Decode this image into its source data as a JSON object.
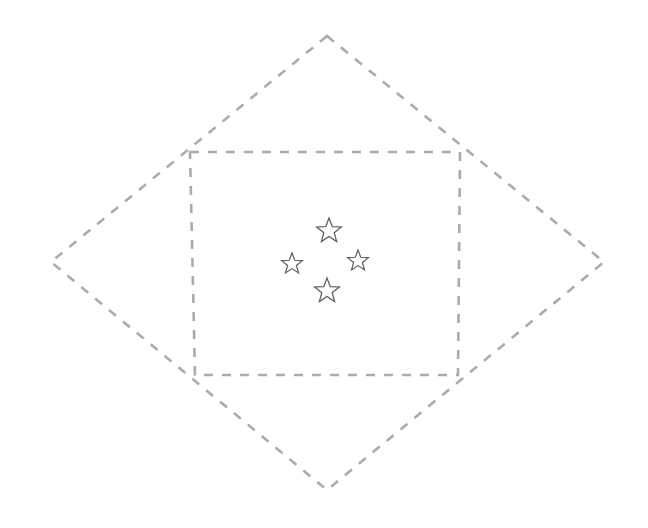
{
  "figure": {
    "canvas": {
      "width": 648,
      "height": 528,
      "background": "#ffffff"
    },
    "stroke": {
      "color": "#ababab",
      "width": 2.6,
      "dash_pattern": "9 9",
      "linecap": "butt"
    },
    "star_style": {
      "stroke_color": "#5a5a5a",
      "fill": "none",
      "stroke_width": 1.2
    },
    "shapes": [
      {
        "name": "outer-diamond",
        "kind": "polygon",
        "points": [
          [
            327,
            36
          ],
          [
            604,
            262
          ],
          [
            327,
            490
          ],
          [
            51,
            262
          ]
        ],
        "vertex_labels": [
          "top",
          "right",
          "bottom",
          "left"
        ]
      },
      {
        "name": "inner-diamond",
        "kind": "polygon",
        "points": [
          [
            190,
            152
          ],
          [
            460,
            152
          ],
          [
            458,
            375
          ],
          [
            195,
            375
          ]
        ],
        "vertex_labels": [
          "top-left",
          "top-right",
          "bottom-right",
          "bottom-left"
        ]
      }
    ],
    "stars": [
      {
        "name": "star-north",
        "cx": 329,
        "cy": 231,
        "radius": 13
      },
      {
        "name": "star-west",
        "cx": 292,
        "cy": 264,
        "radius": 11
      },
      {
        "name": "star-east",
        "cx": 358,
        "cy": 261,
        "radius": 11
      },
      {
        "name": "star-south",
        "cx": 327,
        "cy": 291,
        "radius": 13
      }
    ]
  }
}
